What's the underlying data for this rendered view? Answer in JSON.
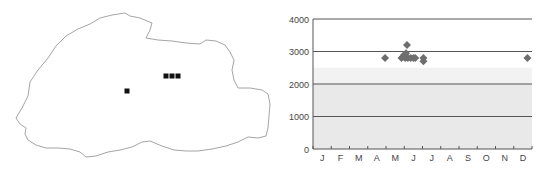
{
  "map": {
    "outline_color": "#9a9a9a",
    "marker_color": "#111111",
    "outline_points": [
      [
        16,
        118
      ],
      [
        22,
        108
      ],
      [
        28,
        96
      ],
      [
        30,
        82
      ],
      [
        38,
        70
      ],
      [
        48,
        58
      ],
      [
        56,
        46
      ],
      [
        66,
        36
      ],
      [
        78,
        29
      ],
      [
        90,
        24
      ],
      [
        100,
        18
      ],
      [
        112,
        15
      ],
      [
        125,
        13
      ],
      [
        130,
        16
      ],
      [
        140,
        18
      ],
      [
        152,
        23
      ],
      [
        150,
        30
      ],
      [
        146,
        38
      ],
      [
        158,
        40
      ],
      [
        172,
        41
      ],
      [
        186,
        43
      ],
      [
        200,
        44
      ],
      [
        206,
        40
      ],
      [
        216,
        41
      ],
      [
        225,
        45
      ],
      [
        230,
        52
      ],
      [
        234,
        60
      ],
      [
        232,
        70
      ],
      [
        234,
        80
      ],
      [
        238,
        88
      ],
      [
        250,
        88
      ],
      [
        262,
        90
      ],
      [
        268,
        94
      ],
      [
        270,
        104
      ],
      [
        269,
        116
      ],
      [
        268,
        128
      ],
      [
        266,
        136
      ],
      [
        258,
        138
      ],
      [
        248,
        137
      ],
      [
        238,
        142
      ],
      [
        226,
        146
      ],
      [
        212,
        149
      ],
      [
        198,
        151
      ],
      [
        186,
        151
      ],
      [
        174,
        150
      ],
      [
        162,
        146
      ],
      [
        150,
        141
      ],
      [
        142,
        142
      ],
      [
        132,
        147
      ],
      [
        120,
        150
      ],
      [
        108,
        152
      ],
      [
        96,
        156
      ],
      [
        86,
        157
      ],
      [
        80,
        152
      ],
      [
        70,
        149
      ],
      [
        58,
        148
      ],
      [
        46,
        148
      ],
      [
        36,
        145
      ],
      [
        28,
        140
      ],
      [
        25,
        134
      ],
      [
        26,
        128
      ],
      [
        20,
        124
      ]
    ],
    "markers": [
      {
        "x": 127,
        "y": 91
      },
      {
        "x": 166,
        "y": 76
      },
      {
        "x": 172,
        "y": 76
      },
      {
        "x": 178,
        "y": 76
      }
    ]
  },
  "chart_data": {
    "type": "scatter",
    "title": "",
    "xlabel": "",
    "ylabel": "",
    "x_tick_labels": [
      "J",
      "F",
      "M",
      "A",
      "M",
      "J",
      "J",
      "A",
      "S",
      "O",
      "N",
      "D"
    ],
    "y_ticks": [
      0,
      1000,
      2000,
      3000,
      4000
    ],
    "y_tick_labels": [
      "0",
      "1000",
      "2000",
      "3000",
      "4000"
    ],
    "ylim": [
      0,
      4000
    ],
    "xlim": [
      0,
      12
    ],
    "grid": "horizontal",
    "legend": "none",
    "marker": "diamond",
    "marker_color": "#6e6e6e",
    "series": [
      {
        "name": "records",
        "points": [
          {
            "month": 3.95,
            "value": 2800
          },
          {
            "month": 4.85,
            "value": 2800
          },
          {
            "month": 4.95,
            "value": 2850
          },
          {
            "month": 5.0,
            "value": 2900
          },
          {
            "month": 5.05,
            "value": 2800
          },
          {
            "month": 5.1,
            "value": 2950
          },
          {
            "month": 5.15,
            "value": 3200
          },
          {
            "month": 5.2,
            "value": 2800
          },
          {
            "month": 5.35,
            "value": 2800
          },
          {
            "month": 5.5,
            "value": 2800
          },
          {
            "month": 5.6,
            "value": 2800
          },
          {
            "month": 6.05,
            "value": 2800
          },
          {
            "month": 6.05,
            "value": 2700
          },
          {
            "month": 11.75,
            "value": 2800
          }
        ]
      }
    ],
    "bands": [
      {
        "from": 0,
        "to": 2000,
        "fill": "#e9e9e9"
      },
      {
        "from": 2000,
        "to": 2500,
        "fill": "#f2f2f2"
      }
    ]
  }
}
